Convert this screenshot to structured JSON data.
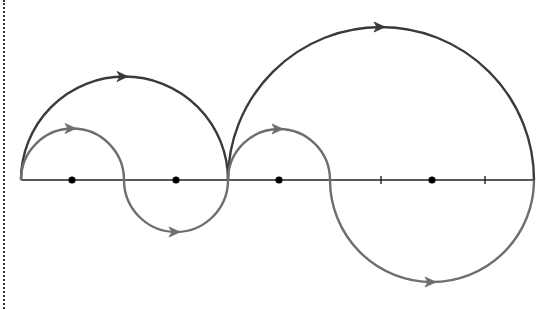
{
  "diagram": {
    "colors": {
      "axis": "#222222",
      "outer_path": "#3a3a3a",
      "inner_path": "#6e6e6e",
      "pole": "#000000",
      "border": "#333333"
    },
    "axis": {
      "y": 180,
      "x_start": 21,
      "x_end": 534
    },
    "poles": [
      {
        "x": 72,
        "y": 180
      },
      {
        "x": 176,
        "y": 180
      },
      {
        "x": 279,
        "y": 180
      },
      {
        "x": 432,
        "y": 180
      }
    ],
    "ticks": [
      {
        "x": 381
      },
      {
        "x": 485
      }
    ],
    "outer_path": {
      "label": "dark-contour",
      "arcs": [
        {
          "from": 21,
          "to": 228,
          "side": "upper",
          "arrow_x": 124
        },
        {
          "from": 228,
          "to": 534,
          "side": "upper",
          "arrow_x": 381
        }
      ]
    },
    "inner_path": {
      "label": "gray-contour",
      "arcs": [
        {
          "from": 21,
          "to": 124,
          "side": "upper",
          "arrow_x": 72
        },
        {
          "from": 124,
          "to": 228,
          "side": "lower",
          "arrow_x": 176
        },
        {
          "from": 228,
          "to": 330,
          "side": "upper",
          "arrow_x": 279
        },
        {
          "from": 330,
          "to": 534,
          "side": "lower",
          "arrow_x": 432
        }
      ]
    }
  }
}
